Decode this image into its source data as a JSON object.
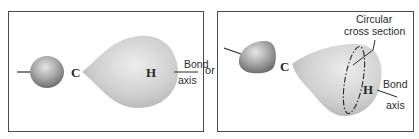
{
  "diagram": {
    "left_panel": {
      "carbon_label": "C",
      "hydrogen_label": "H",
      "bond_axis_line1": "Bond",
      "bond_axis_line2": "axis"
    },
    "separator": "or",
    "right_panel": {
      "carbon_label": "C",
      "hydrogen_label": "H",
      "cross_section_line1": "Circular",
      "cross_section_line2": "cross section",
      "bond_axis_line1": "Bond",
      "bond_axis_line2": "axis"
    },
    "colors": {
      "border": "#4a4a4a",
      "orbital_light": "#e4e4e4",
      "orbital_dark": "#b5b5b5",
      "sphere_dark": "#7d7d7d",
      "text": "#2a2a2a"
    }
  }
}
